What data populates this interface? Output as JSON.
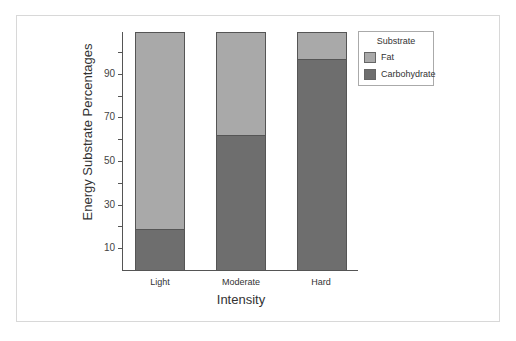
{
  "chart_data": {
    "type": "bar",
    "stacked": true,
    "title": "",
    "xlabel": "Intensity",
    "ylabel": "Energy Substrate Percentages",
    "categories": [
      "Light",
      "Moderate",
      "Hard"
    ],
    "series": [
      {
        "name": "Carbohydrate",
        "values": [
          19,
          62,
          97
        ],
        "color": "#6e6e6e"
      },
      {
        "name": "Fat",
        "values": [
          90,
          47,
          12
        ],
        "color": "#a9a9a9"
      }
    ],
    "yticks": [
      10,
      30,
      50,
      70,
      90
    ],
    "ylim": [
      0,
      110
    ],
    "grid": false,
    "legend": {
      "title": "Substrate",
      "position": "top-right",
      "entries": [
        "Fat",
        "Carbohydrate"
      ]
    }
  },
  "axis": {
    "y_title": "Energy Substrate Percentages",
    "x_title": "Intensity",
    "tick_labels": [
      "10",
      "30",
      "50",
      "70",
      "90"
    ]
  },
  "categories": [
    "Light",
    "Moderate",
    "Hard"
  ],
  "legend": {
    "title": "Substrate",
    "items": [
      {
        "label": "Fat",
        "color": "#a9a9a9"
      },
      {
        "label": "Carbohydrate",
        "color": "#6e6e6e"
      }
    ]
  }
}
